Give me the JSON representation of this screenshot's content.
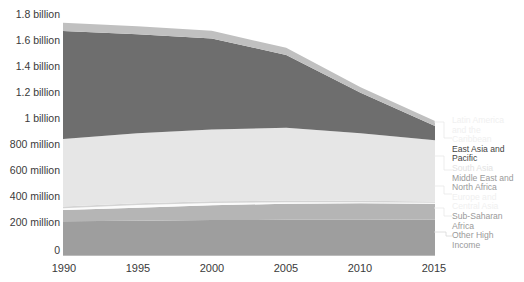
{
  "chart_data": {
    "type": "area",
    "stacked": true,
    "title": "",
    "xlabel": "",
    "ylabel": "",
    "x": [
      1990,
      1995,
      2000,
      2005,
      2010,
      2015
    ],
    "xlim": [
      1990,
      2015
    ],
    "ylim": [
      0,
      1800
    ],
    "yunit": "millions of people",
    "grid": false,
    "legend_position": "right",
    "xticks": [
      "1990",
      "1995",
      "2000",
      "2005",
      "2010",
      "2015"
    ],
    "yticks": [
      "0",
      "200 million",
      "400 million",
      "600 million",
      "800 million",
      "1 billion",
      "1.2 billion",
      "1.4 billion",
      "1.6 billion",
      "1.8 billion"
    ],
    "ytick_values": [
      0,
      200,
      400,
      600,
      800,
      1000,
      1200,
      1400,
      1600,
      1800
    ],
    "series": [
      {
        "name": "Other High Income",
        "color": "#9e9e9e",
        "values": [
          268,
          272,
          276,
          278,
          279,
          280
        ]
      },
      {
        "name": "Sub-Saharan Africa",
        "color": "#b5b5b5",
        "values": [
          86,
          100,
          114,
          124,
          126,
          122
        ]
      },
      {
        "name": "Europe and Central Asia",
        "color": "#fbfbfb",
        "values": [
          14,
          20,
          18,
          12,
          9,
          7
        ]
      },
      {
        "name": "Middle East and North Africa",
        "color": "#d4d4d4",
        "values": [
          12,
          13,
          13,
          12,
          11,
          11
        ]
      },
      {
        "name": "South Asia",
        "color": "#e6e6e6",
        "values": [
          520,
          540,
          552,
          560,
          520,
          470
        ]
      },
      {
        "name": "East Asia and Pacific",
        "color": "#6e6e6e",
        "values": [
          830,
          760,
          700,
          560,
          310,
          110
        ]
      },
      {
        "name": "Latin America and the Caribbean",
        "color": "#c0c0c0",
        "values": [
          65,
          62,
          60,
          55,
          44,
          38
        ]
      }
    ],
    "totals": [
      1795,
      1767,
      1733,
      1601,
      1299,
      1038
    ]
  },
  "axis": {
    "y_labels": [
      {
        "text": "1.8 billion",
        "top": 8
      },
      {
        "text": "1.6 billion",
        "top": 34
      },
      {
        "text": "1.4 billion",
        "top": 60
      },
      {
        "text": "1.2 billion",
        "top": 86
      },
      {
        "text": "1 billion",
        "top": 112
      },
      {
        "text": "800 million",
        "top": 138
      },
      {
        "text": "600 million",
        "top": 164
      },
      {
        "text": "400 million",
        "top": 190
      },
      {
        "text": "200 million",
        "top": 216
      },
      {
        "text": "0",
        "top": 244
      }
    ],
    "x_labels": [
      {
        "text": "1990",
        "left": 44
      },
      {
        "text": "1995",
        "left": 118
      },
      {
        "text": "2000",
        "left": 192
      },
      {
        "text": "2005",
        "left": 266
      },
      {
        "text": "2010",
        "left": 340
      },
      {
        "text": "2015",
        "left": 414
      }
    ]
  },
  "legend": {
    "entries": [
      {
        "label": "Latin America",
        "tone": "faint"
      },
      {
        "label": "and the",
        "tone": "faint"
      },
      {
        "label": "Caribbean",
        "tone": "faint"
      },
      {
        "label": "East Asia and",
        "tone": "dark"
      },
      {
        "label": "Pacific",
        "tone": "dark"
      },
      {
        "label": "South Asia",
        "tone": "faint2"
      },
      {
        "label": "Middle East and",
        "tone": "mid"
      },
      {
        "label": "North Africa",
        "tone": "mid"
      },
      {
        "label": "Europe and",
        "tone": "faint"
      },
      {
        "label": "Central Asia",
        "tone": "faint"
      },
      {
        "label": "Sub-Saharan",
        "tone": "mid"
      },
      {
        "label": "Africa",
        "tone": "mid"
      },
      {
        "label": "Other High",
        "tone": "mid"
      },
      {
        "label": "Income",
        "tone": "mid"
      }
    ]
  },
  "caption": {
    "text": ""
  }
}
